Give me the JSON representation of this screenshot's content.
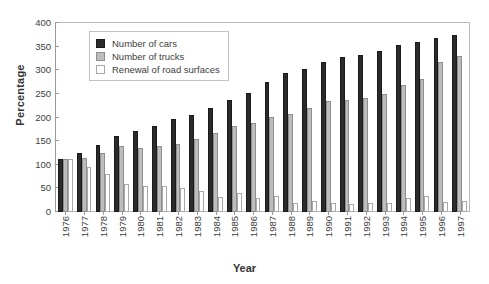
{
  "chart_data": {
    "type": "bar",
    "title": "",
    "xlabel": "Year",
    "ylabel": "Percentage",
    "ylim": [
      0,
      400
    ],
    "yticks": [
      0,
      50,
      100,
      150,
      200,
      250,
      300,
      350,
      400
    ],
    "grid": false,
    "legend_position": "upper-left-inside",
    "categories": [
      "1976",
      "1977",
      "1978",
      "1979",
      "1980",
      "1981",
      "1982",
      "1983",
      "1984",
      "1985",
      "1986",
      "1987",
      "1988",
      "1989",
      "1990",
      "1991",
      "1992",
      "1993",
      "1994",
      "1995",
      "1996",
      "1997"
    ],
    "series": [
      {
        "name": "Number of cars",
        "color": "#2b2b2b",
        "values": [
          113,
          125,
          141,
          160,
          171,
          183,
          196,
          206,
          221,
          237,
          251,
          276,
          294,
          302,
          317,
          329,
          333,
          340,
          353,
          360,
          369,
          375
        ]
      },
      {
        "name": "Number of trucks",
        "color": "#bdbdbd",
        "values": [
          113,
          115,
          124,
          139,
          136,
          139,
          144,
          155,
          167,
          182,
          188,
          201,
          207,
          221,
          235,
          238,
          242,
          249,
          269,
          282,
          317,
          331
        ]
      },
      {
        "name": "Renewal of road surfaces",
        "color": "#ffffff",
        "values": [
          113,
          96,
          80,
          60,
          56,
          56,
          51,
          44,
          31,
          40,
          30,
          33,
          19,
          24,
          20,
          16,
          19,
          19,
          30,
          33,
          22,
          24
        ]
      }
    ]
  },
  "axes": {
    "y_title": "Percentage",
    "x_title": "Year"
  },
  "legend": {
    "items": [
      {
        "label": "Number of cars",
        "swatch": "cars-swatch"
      },
      {
        "label": "Number of trucks",
        "swatch": "trucks-swatch"
      },
      {
        "label": "Renewal of road surfaces",
        "swatch": "renewal-swatch"
      }
    ]
  }
}
